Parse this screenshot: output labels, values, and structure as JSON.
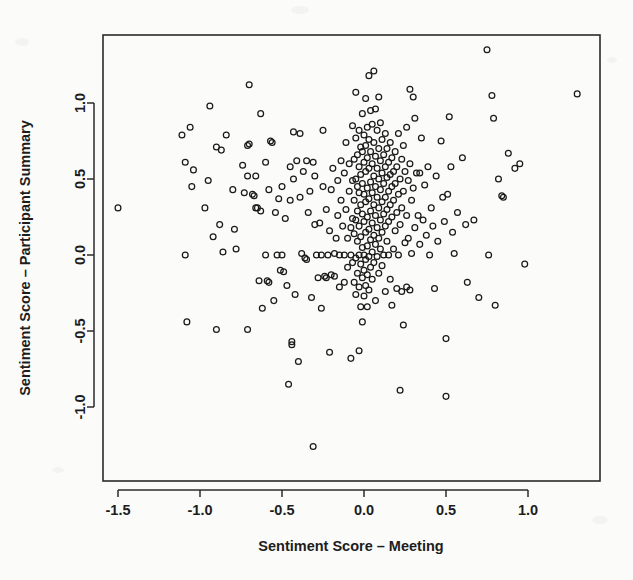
{
  "chart_data": {
    "type": "scatter",
    "title": "",
    "xlabel": "Sentiment Score – Meeting",
    "ylabel": "Sentiment Score – Participant Summary",
    "xlim": [
      -1.62,
      1.42
    ],
    "ylim": [
      -1.35,
      1.42
    ],
    "xticks": [
      -1.5,
      -1.0,
      -0.5,
      0.0,
      0.5,
      1.0
    ],
    "xtick_labels": [
      "-1.5",
      "-1.0",
      "-0.5",
      "0.0",
      "0.5",
      "1.0"
    ],
    "yticks": [
      -1.0,
      -0.5,
      0.0,
      0.5,
      1.0
    ],
    "ytick_labels": [
      "-1.0",
      "-0.5",
      "0.0",
      "0.5",
      "1.0"
    ],
    "grid": false,
    "legend": null,
    "marker": "open-circle",
    "marker_color": "#1a1a1a",
    "n_points": 297,
    "points": [
      [
        -1.5,
        0.31
      ],
      [
        -1.09,
        0.61
      ],
      [
        -1.09,
        0.0
      ],
      [
        -1.11,
        0.79
      ],
      [
        -1.06,
        0.84
      ],
      [
        -1.05,
        0.45
      ],
      [
        -1.04,
        0.56
      ],
      [
        -1.08,
        -0.44
      ],
      [
        -0.97,
        0.31
      ],
      [
        -0.95,
        0.49
      ],
      [
        -0.94,
        0.98
      ],
      [
        -0.92,
        0.12
      ],
      [
        -0.9,
        0.71
      ],
      [
        -0.88,
        0.2
      ],
      [
        -0.87,
        0.69
      ],
      [
        -0.86,
        0.02
      ],
      [
        -0.9,
        -0.49
      ],
      [
        -0.84,
        0.79
      ],
      [
        -0.8,
        0.43
      ],
      [
        -0.79,
        0.17
      ],
      [
        -0.78,
        0.04
      ],
      [
        -0.74,
        0.59
      ],
      [
        -0.73,
        0.41
      ],
      [
        -0.71,
        0.52
      ],
      [
        -0.71,
        0.72
      ],
      [
        -0.7,
        0.73
      ],
      [
        -0.7,
        1.12
      ],
      [
        -0.71,
        -0.49
      ],
      [
        -0.68,
        0.4
      ],
      [
        -0.67,
        0.39
      ],
      [
        -0.66,
        0.52
      ],
      [
        -0.66,
        0.31
      ],
      [
        -0.65,
        0.31
      ],
      [
        -0.64,
        -0.17
      ],
      [
        -0.63,
        0.93
      ],
      [
        -0.63,
        0.29
      ],
      [
        -0.62,
        -0.35
      ],
      [
        -0.6,
        0.0
      ],
      [
        -0.6,
        0.61
      ],
      [
        -0.59,
        -0.17
      ],
      [
        -0.58,
        0.43
      ],
      [
        -0.58,
        -0.18
      ],
      [
        -0.57,
        0.75
      ],
      [
        -0.56,
        0.74
      ],
      [
        -0.55,
        -0.3
      ],
      [
        -0.54,
        0.28
      ],
      [
        -0.53,
        0.0
      ],
      [
        -0.52,
        0.37
      ],
      [
        -0.51,
        -0.1
      ],
      [
        -0.5,
        0.0
      ],
      [
        -0.5,
        0.45
      ],
      [
        -0.49,
        -0.11
      ],
      [
        -0.48,
        0.24
      ],
      [
        -0.47,
        -0.2
      ],
      [
        -0.46,
        -0.85
      ],
      [
        -0.45,
        0.58
      ],
      [
        -0.45,
        0.36
      ],
      [
        -0.44,
        -0.57
      ],
      [
        -0.44,
        -0.59
      ],
      [
        -0.43,
        0.81
      ],
      [
        -0.43,
        0.5
      ],
      [
        -0.42,
        -0.26
      ],
      [
        -0.41,
        0.62
      ],
      [
        -0.4,
        -0.7
      ],
      [
        -0.39,
        0.8
      ],
      [
        -0.39,
        0.38
      ],
      [
        -0.38,
        0.01
      ],
      [
        -0.37,
        0.55
      ],
      [
        -0.36,
        -0.02
      ],
      [
        -0.35,
        0.62
      ],
      [
        -0.35,
        -0.03
      ],
      [
        -0.34,
        0.28
      ],
      [
        -0.33,
        0.42
      ],
      [
        -0.32,
        -0.28
      ],
      [
        -0.31,
        -1.26
      ],
      [
        -0.31,
        0.61
      ],
      [
        -0.3,
        0.52
      ],
      [
        -0.3,
        0.2
      ],
      [
        -0.29,
        0.0
      ],
      [
        -0.28,
        -0.15
      ],
      [
        -0.27,
        0.21
      ],
      [
        -0.26,
        0.0
      ],
      [
        -0.26,
        -0.35
      ],
      [
        -0.25,
        0.45
      ],
      [
        -0.25,
        0.82
      ],
      [
        -0.24,
        -0.14
      ],
      [
        -0.23,
        0.3
      ],
      [
        -0.23,
        -0.15
      ],
      [
        -0.22,
        0.0
      ],
      [
        -0.21,
        0.16
      ],
      [
        -0.21,
        -0.64
      ],
      [
        -0.2,
        0.43
      ],
      [
        -0.2,
        -0.13
      ],
      [
        -0.19,
        0.57
      ],
      [
        -0.18,
        0.01
      ],
      [
        -0.18,
        -0.14
      ],
      [
        -0.17,
        0.11
      ],
      [
        -0.16,
        0.49
      ],
      [
        -0.16,
        0.26
      ],
      [
        -0.15,
        0.0
      ],
      [
        -0.15,
        -0.21
      ],
      [
        -0.14,
        0.62
      ],
      [
        -0.14,
        0.36
      ],
      [
        -0.13,
        0.19
      ],
      [
        -0.12,
        0.0
      ],
      [
        -0.12,
        0.54
      ],
      [
        -0.12,
        -0.18
      ],
      [
        -0.11,
        0.74
      ],
      [
        -0.11,
        0.3
      ],
      [
        -0.1,
        0.11
      ],
      [
        -0.1,
        -0.08
      ],
      [
        -0.09,
        0.6
      ],
      [
        -0.09,
        0.42
      ],
      [
        -0.08,
        0.0
      ],
      [
        -0.08,
        0.18
      ],
      [
        -0.08,
        -0.68
      ],
      [
        -0.07,
        0.85
      ],
      [
        -0.07,
        0.49
      ],
      [
        -0.07,
        0.24
      ],
      [
        -0.07,
        -0.05
      ],
      [
        -0.06,
        0.63
      ],
      [
        -0.06,
        0.36
      ],
      [
        -0.06,
        0.14
      ],
      [
        -0.06,
        -0.18
      ],
      [
        -0.05,
        1.07
      ],
      [
        -0.05,
        0.77
      ],
      [
        -0.05,
        0.5
      ],
      [
        -0.05,
        0.23
      ],
      [
        -0.05,
        -0.02
      ],
      [
        -0.05,
        -0.26
      ],
      [
        -0.04,
        0.66
      ],
      [
        -0.04,
        0.45
      ],
      [
        -0.04,
        0.29
      ],
      [
        -0.04,
        0.09
      ],
      [
        -0.04,
        -0.12
      ],
      [
        -0.03,
        0.82
      ],
      [
        -0.03,
        0.58
      ],
      [
        -0.03,
        0.41
      ],
      [
        -0.03,
        0.19
      ],
      [
        -0.03,
        0.0
      ],
      [
        -0.03,
        -0.21
      ],
      [
        -0.03,
        -0.63
      ],
      [
        -0.02,
        0.71
      ],
      [
        -0.02,
        0.53
      ],
      [
        -0.02,
        0.33
      ],
      [
        -0.02,
        0.12
      ],
      [
        -0.02,
        -0.06
      ],
      [
        -0.02,
        -0.34
      ],
      [
        -0.01,
        0.93
      ],
      [
        -0.01,
        0.68
      ],
      [
        -0.01,
        0.47
      ],
      [
        -0.01,
        0.27
      ],
      [
        -0.01,
        0.05
      ],
      [
        -0.01,
        -0.15
      ],
      [
        -0.01,
        -0.44
      ],
      [
        0.0,
        0.79
      ],
      [
        0.0,
        0.61
      ],
      [
        0.0,
        0.4
      ],
      [
        0.0,
        0.22
      ],
      [
        0.0,
        0.0
      ],
      [
        0.0,
        -0.1
      ],
      [
        0.0,
        -0.27
      ],
      [
        0.01,
        1.03
      ],
      [
        0.01,
        0.72
      ],
      [
        0.01,
        0.55
      ],
      [
        0.01,
        0.35
      ],
      [
        0.01,
        0.15
      ],
      [
        0.01,
        -0.03
      ],
      [
        0.01,
        -0.2
      ],
      [
        0.02,
        0.84
      ],
      [
        0.02,
        0.64
      ],
      [
        0.02,
        0.44
      ],
      [
        0.02,
        0.25
      ],
      [
        0.02,
        0.06
      ],
      [
        0.02,
        -0.13
      ],
      [
        0.02,
        -0.34
      ],
      [
        0.03,
        1.18
      ],
      [
        0.03,
        0.76
      ],
      [
        0.03,
        0.57
      ],
      [
        0.03,
        0.37
      ],
      [
        0.03,
        0.17
      ],
      [
        0.03,
        -0.01
      ],
      [
        0.03,
        -0.23
      ],
      [
        0.04,
        0.95
      ],
      [
        0.04,
        0.68
      ],
      [
        0.04,
        0.48
      ],
      [
        0.04,
        0.29
      ],
      [
        0.04,
        0.1
      ],
      [
        0.04,
        -0.08
      ],
      [
        0.05,
        0.86
      ],
      [
        0.05,
        0.6
      ],
      [
        0.05,
        0.41
      ],
      [
        0.05,
        0.21
      ],
      [
        0.05,
        0.02
      ],
      [
        0.05,
        -0.16
      ],
      [
        0.06,
        1.21
      ],
      [
        0.06,
        0.74
      ],
      [
        0.06,
        0.52
      ],
      [
        0.06,
        0.33
      ],
      [
        0.06,
        0.13
      ],
      [
        0.06,
        -0.05
      ],
      [
        0.07,
        0.96
      ],
      [
        0.07,
        0.65
      ],
      [
        0.07,
        0.45
      ],
      [
        0.07,
        0.26
      ],
      [
        0.07,
        0.07
      ],
      [
        0.07,
        -0.3
      ],
      [
        0.08,
        0.82
      ],
      [
        0.08,
        0.57
      ],
      [
        0.08,
        0.38
      ],
      [
        0.08,
        0.18
      ],
      [
        0.08,
        -0.01
      ],
      [
        0.09,
        1.04
      ],
      [
        0.09,
        0.7
      ],
      [
        0.09,
        0.5
      ],
      [
        0.09,
        0.31
      ],
      [
        0.09,
        0.11
      ],
      [
        0.09,
        -0.12
      ],
      [
        0.1,
        0.87
      ],
      [
        0.1,
        0.62
      ],
      [
        0.1,
        0.43
      ],
      [
        0.1,
        0.23
      ],
      [
        0.1,
        0.04
      ],
      [
        0.11,
        0.76
      ],
      [
        0.11,
        0.54
      ],
      [
        0.11,
        0.35
      ],
      [
        0.11,
        0.15
      ],
      [
        0.11,
        -0.07
      ],
      [
        0.12,
        0.66
      ],
      [
        0.12,
        0.47
      ],
      [
        0.12,
        0.27
      ],
      [
        0.12,
        0.0
      ],
      [
        0.13,
        0.8
      ],
      [
        0.13,
        0.58
      ],
      [
        0.13,
        0.38
      ],
      [
        0.13,
        0.19
      ],
      [
        0.13,
        -0.24
      ],
      [
        0.14,
        0.7
      ],
      [
        0.14,
        0.51
      ],
      [
        0.14,
        0.3
      ],
      [
        0.14,
        0.09
      ],
      [
        0.15,
        0.61
      ],
      [
        0.15,
        0.42
      ],
      [
        0.15,
        0.22
      ],
      [
        0.15,
        0.0
      ],
      [
        0.16,
        0.74
      ],
      [
        0.16,
        0.53
      ],
      [
        0.16,
        0.33
      ],
      [
        0.16,
        -0.16
      ],
      [
        0.17,
        0.64
      ],
      [
        0.17,
        0.45
      ],
      [
        0.17,
        0.25
      ],
      [
        0.17,
        -0.33
      ],
      [
        0.18,
        0.55
      ],
      [
        0.18,
        0.36
      ],
      [
        0.18,
        0.04
      ],
      [
        0.19,
        0.68
      ],
      [
        0.19,
        0.47
      ],
      [
        0.19,
        0.16
      ],
      [
        0.2,
        0.58
      ],
      [
        0.2,
        0.28
      ],
      [
        0.2,
        -0.22
      ],
      [
        0.21,
        0.8
      ],
      [
        0.21,
        0.4
      ],
      [
        0.21,
        0.0
      ],
      [
        0.22,
        0.5
      ],
      [
        0.22,
        0.2
      ],
      [
        0.22,
        -0.89
      ],
      [
        0.23,
        0.63
      ],
      [
        0.23,
        0.31
      ],
      [
        0.23,
        -0.24
      ],
      [
        0.24,
        0.72
      ],
      [
        0.24,
        0.42
      ],
      [
        0.24,
        -0.46
      ],
      [
        0.25,
        0.55
      ],
      [
        0.25,
        0.08
      ],
      [
        0.26,
        0.84
      ],
      [
        0.26,
        0.26
      ],
      [
        0.26,
        -0.21
      ],
      [
        0.27,
        0.49
      ],
      [
        0.27,
        0.11
      ],
      [
        0.28,
        1.09
      ],
      [
        0.28,
        0.6
      ],
      [
        0.28,
        -0.23
      ],
      [
        0.29,
        0.36
      ],
      [
        0.29,
        0.01
      ],
      [
        0.3,
        1.04
      ],
      [
        0.3,
        0.44
      ],
      [
        0.31,
        0.9
      ],
      [
        0.31,
        0.18
      ],
      [
        0.32,
        0.54
      ],
      [
        0.33,
        0.26
      ],
      [
        0.34,
        0.54
      ],
      [
        0.34,
        0.07
      ],
      [
        0.35,
        0.77
      ],
      [
        0.36,
        0.23
      ],
      [
        0.37,
        0.46
      ],
      [
        0.38,
        0.13
      ],
      [
        0.39,
        0.58
      ],
      [
        0.4,
        0.0
      ],
      [
        0.41,
        0.31
      ],
      [
        0.42,
        0.19
      ],
      [
        0.43,
        -0.22
      ],
      [
        0.44,
        0.52
      ],
      [
        0.45,
        0.09
      ],
      [
        0.47,
        0.75
      ],
      [
        0.48,
        0.38
      ],
      [
        0.49,
        0.22
      ],
      [
        0.5,
        -0.55
      ],
      [
        0.5,
        -0.93
      ],
      [
        0.51,
        0.4
      ],
      [
        0.52,
        0.91
      ],
      [
        0.53,
        0.58
      ],
      [
        0.54,
        0.15
      ],
      [
        0.55,
        0.01
      ],
      [
        0.57,
        0.28
      ],
      [
        0.6,
        0.64
      ],
      [
        0.62,
        0.2
      ],
      [
        0.63,
        -0.18
      ],
      [
        0.67,
        0.23
      ],
      [
        0.7,
        -0.28
      ],
      [
        0.75,
        1.35
      ],
      [
        0.76,
        0.0
      ],
      [
        0.78,
        1.05
      ],
      [
        0.79,
        0.9
      ],
      [
        0.8,
        -0.33
      ],
      [
        0.82,
        0.5
      ],
      [
        0.84,
        0.39
      ],
      [
        0.85,
        0.38
      ],
      [
        0.88,
        0.67
      ],
      [
        0.92,
        0.57
      ],
      [
        0.95,
        0.6
      ],
      [
        0.98,
        -0.06
      ],
      [
        1.3,
        1.06
      ]
    ]
  }
}
